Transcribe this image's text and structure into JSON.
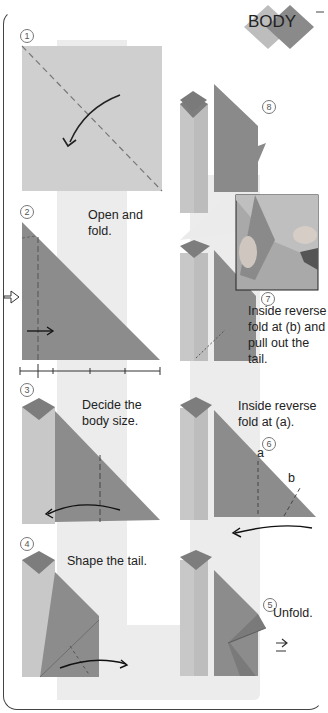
{
  "header": {
    "title": "BODY"
  },
  "colors": {
    "paper_light": "#c8c8c8",
    "paper_dark": "#8c8c8c",
    "diamond_dark": "#7a7a7a",
    "band": "#ececec",
    "line": "#222222"
  },
  "steps": [
    {
      "number": "1",
      "label": "",
      "instruction": ""
    },
    {
      "number": "2",
      "label": "",
      "instruction": "Open and fold."
    },
    {
      "number": "3",
      "label": "",
      "instruction": "Decide the body size."
    },
    {
      "number": "4",
      "label": "",
      "instruction": "Shape the tail."
    },
    {
      "number": "5",
      "label": "",
      "instruction": "Unfold."
    },
    {
      "number": "6",
      "label": "",
      "instruction": "Inside reverse fold at (a).",
      "markers": [
        "a",
        "b"
      ]
    },
    {
      "number": "7",
      "label": "",
      "instruction": "Inside reverse fold at (b) and pull out the tail."
    },
    {
      "number": "8",
      "label": "",
      "instruction": ""
    }
  ],
  "text": {
    "s2_line1": "Open and",
    "s2_line2": "fold.",
    "s3_line1": "Decide the",
    "s3_line2": "body size.",
    "s4": "Shape the tail.",
    "s5": "Unfold.",
    "s6_line1": "Inside reverse",
    "s6_line2": "fold at (a).",
    "s7_line1": "Inside reverse",
    "s7_line2": "fold at (b) and",
    "s7_line3": "pull out the",
    "s7_line4": "tail.",
    "marker_a": "a",
    "marker_b": "b"
  },
  "numbers": {
    "n1": "1",
    "n2": "2",
    "n3": "3",
    "n4": "4",
    "n5": "5",
    "n6": "6",
    "n7": "7",
    "n8": "8"
  }
}
